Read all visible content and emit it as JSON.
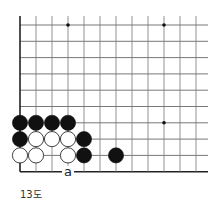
{
  "diagram": {
    "caption": "13도",
    "grid": {
      "x0": 20,
      "y0": 25,
      "spacing_x": 16,
      "spacing_y": 16.3,
      "cols": 12,
      "rows": 10,
      "edge_left": true,
      "edge_bottom": true
    },
    "star_points": [
      [
        3,
        0
      ],
      [
        9,
        0
      ],
      [
        9,
        6
      ]
    ],
    "stones": [
      {
        "color": "black",
        "col": 0,
        "row": 6
      },
      {
        "color": "black",
        "col": 1,
        "row": 6
      },
      {
        "color": "black",
        "col": 2,
        "row": 6
      },
      {
        "color": "black",
        "col": 3,
        "row": 6
      },
      {
        "color": "black",
        "col": 0,
        "row": 7
      },
      {
        "color": "white",
        "col": 1,
        "row": 7
      },
      {
        "color": "white",
        "col": 2,
        "row": 7
      },
      {
        "color": "white",
        "col": 3,
        "row": 7
      },
      {
        "color": "black",
        "col": 4,
        "row": 7
      },
      {
        "color": "white",
        "col": 0,
        "row": 8
      },
      {
        "color": "white",
        "col": 1,
        "row": 8
      },
      {
        "color": "white",
        "col": 3,
        "row": 8
      },
      {
        "color": "black",
        "col": 4,
        "row": 8
      },
      {
        "color": "black",
        "col": 6,
        "row": 8
      }
    ],
    "labels": [
      {
        "text": "a",
        "col": 3,
        "row": 9
      }
    ]
  }
}
